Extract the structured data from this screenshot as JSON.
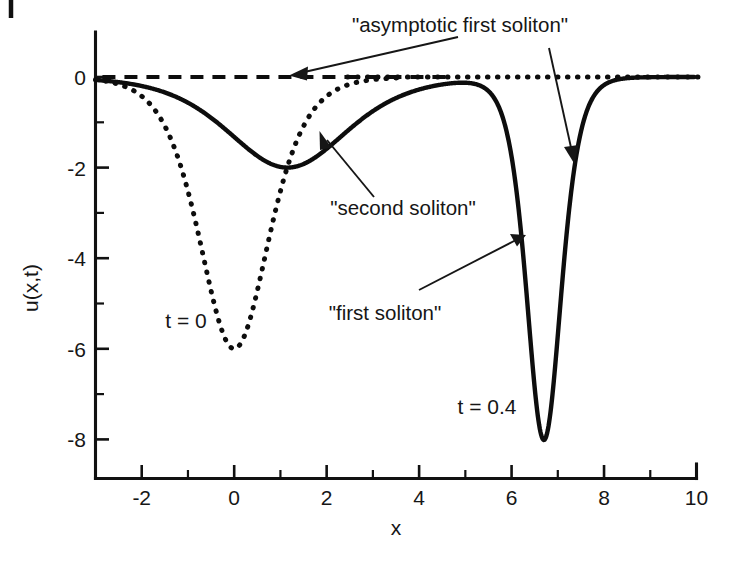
{
  "figure": {
    "title": "",
    "background_color": "#ffffff",
    "ink_color": "#0d0d0d"
  },
  "axes": {
    "x_title": "x",
    "y_title": "u(x,t)",
    "x_major_ticks": [
      "-2",
      "0",
      "2",
      "4",
      "6",
      "8",
      "10"
    ],
    "y_major_ticks": [
      "0",
      "-2",
      "-4",
      "-6",
      "-8"
    ]
  },
  "annotations": {
    "asymptotic": "\"asymptotic first soliton\"",
    "second": "\"second soliton\"",
    "first": "\"first soliton\"",
    "t_initial": "t = 0",
    "t_final": "t = 0.4"
  },
  "chart_data": {
    "type": "line",
    "title": "",
    "xlabel": "x",
    "ylabel": "u(x,t)",
    "xlim": [
      -3,
      10
    ],
    "ylim": [
      -8.6,
      0.85
    ],
    "x_major_ticks": [
      -2,
      0,
      2,
      4,
      6,
      8,
      10
    ],
    "x_minor_ticks": [
      -3,
      -1,
      1,
      3,
      5,
      7,
      9
    ],
    "y_major_ticks": [
      0,
      -2,
      -4,
      -6,
      -8
    ],
    "y_minor_ticks": [
      -1,
      -3,
      -5,
      -7
    ],
    "grid": false,
    "legend": "none",
    "series": [
      {
        "name": "t = 0",
        "style": "dotted",
        "description": "Initial two-soliton profile: single deep well of depth -6 centered at x = 0, returning to 0 for x > 3.5",
        "type": "sech2_well",
        "amplitude": -6.0,
        "center": 0.0,
        "width": 1.0,
        "baseline": 0.0
      },
      {
        "name": "t = 0.4",
        "style": "solid",
        "description": "Separated solitons: broad shallow well of depth -2 near x = 1.15 and narrow deep well of depth -8 at x = 6.7",
        "components": [
          {
            "amplitude": -2.0,
            "center": 1.15,
            "width": 1.73
          },
          {
            "amplitude": -8.0,
            "center": 6.7,
            "width": 0.5
          }
        ]
      },
      {
        "name": "asymptotic first soliton",
        "style": "dashed",
        "description": "Zero-level dashed reference line across the plot",
        "value": 0.0
      }
    ],
    "annotations": [
      {
        "text": "\"asymptotic first soliton\"",
        "points_to": [
          [
            -0.25,
            0.0
          ],
          [
            6.4,
            -2.5
          ]
        ]
      },
      {
        "text": "\"second soliton\"",
        "points_to": [
          [
            1.6,
            -1.7
          ]
        ]
      },
      {
        "text": "\"first soliton\"",
        "points_to": [
          [
            6.2,
            -3.5
          ]
        ]
      },
      {
        "text": "t = 0",
        "at": [
          -1.6,
          -5.6
        ]
      },
      {
        "text": "t = 0.4",
        "at": [
          5.15,
          -7.0
        ]
      }
    ]
  }
}
